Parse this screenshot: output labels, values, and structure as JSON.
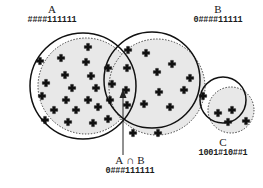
{
  "figure": {
    "type": "venn-diagram",
    "title": "",
    "background_color": "#ffffff",
    "fill_color": "#e8e8e8",
    "stroke_color": "#1a1a1a",
    "marker_glyph": "+",
    "marker_count": 42
  },
  "labels": {
    "set_a": {
      "name": "A",
      "code": "####111111"
    },
    "set_b": {
      "name": "B",
      "code": "0####11111"
    },
    "set_c": {
      "name": "C",
      "code": "1001#10##1"
    },
    "intersection_ab": {
      "left": "A",
      "operator": "∩",
      "right": "B",
      "code": "0###111111"
    }
  },
  "shapes": {
    "circle_a_solid": {
      "cx": 83,
      "cy": 86,
      "r": 53
    },
    "circle_a_dotted": {
      "cx": 86,
      "cy": 86,
      "r": 48
    },
    "circle_b_solid": {
      "cx": 152,
      "cy": 80,
      "r": 48
    },
    "circle_b_dotted": {
      "cx": 157,
      "cy": 87,
      "r": 48
    },
    "circle_c_solid": {
      "cx": 223,
      "cy": 100,
      "r": 23
    },
    "circle_c_dotted": {
      "cx": 231,
      "cy": 110,
      "r": 23
    },
    "arrow": {
      "x1": 123,
      "y1": 155,
      "x2": 123,
      "y2": 95
    }
  },
  "markers": [
    {
      "x": 88,
      "y": 47
    },
    {
      "x": 61,
      "y": 58
    },
    {
      "x": 86,
      "y": 62
    },
    {
      "x": 40,
      "y": 61
    },
    {
      "x": 65,
      "y": 75
    },
    {
      "x": 91,
      "y": 76
    },
    {
      "x": 46,
      "y": 83
    },
    {
      "x": 72,
      "y": 88
    },
    {
      "x": 96,
      "y": 88
    },
    {
      "x": 42,
      "y": 96
    },
    {
      "x": 66,
      "y": 100
    },
    {
      "x": 88,
      "y": 100
    },
    {
      "x": 54,
      "y": 110
    },
    {
      "x": 76,
      "y": 110
    },
    {
      "x": 98,
      "y": 107
    },
    {
      "x": 45,
      "y": 120
    },
    {
      "x": 68,
      "y": 122
    },
    {
      "x": 93,
      "y": 123
    },
    {
      "x": 108,
      "y": 68
    },
    {
      "x": 128,
      "y": 50
    },
    {
      "x": 112,
      "y": 84
    },
    {
      "x": 127,
      "y": 68
    },
    {
      "x": 110,
      "y": 100
    },
    {
      "x": 126,
      "y": 90
    },
    {
      "x": 108,
      "y": 119
    },
    {
      "x": 127,
      "y": 105
    },
    {
      "x": 146,
      "y": 53
    },
    {
      "x": 172,
      "y": 64
    },
    {
      "x": 157,
      "y": 72
    },
    {
      "x": 190,
      "y": 78
    },
    {
      "x": 159,
      "y": 92
    },
    {
      "x": 184,
      "y": 90
    },
    {
      "x": 144,
      "y": 104
    },
    {
      "x": 170,
      "y": 107
    },
    {
      "x": 133,
      "y": 133
    },
    {
      "x": 158,
      "y": 133
    },
    {
      "x": 203,
      "y": 96
    },
    {
      "x": 218,
      "y": 113
    },
    {
      "x": 232,
      "y": 110
    },
    {
      "x": 228,
      "y": 122
    },
    {
      "x": 246,
      "y": 121
    }
  ]
}
